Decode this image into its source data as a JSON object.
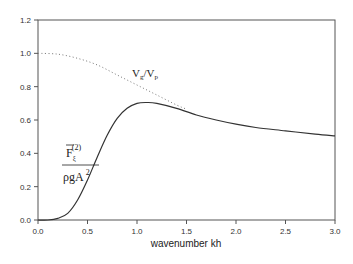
{
  "chart_data": {
    "type": "line",
    "title": "",
    "xlabel": "wavenumber kh",
    "ylabel": "",
    "xlim": [
      0.0,
      3.0
    ],
    "ylim": [
      0.0,
      1.2
    ],
    "grid": false,
    "legend": "none",
    "x_ticks": [
      "0.0",
      "0.5",
      "1.0",
      "1.5",
      "2.0",
      "2.5",
      "3.0"
    ],
    "y_ticks": [
      "0.0",
      "0.2",
      "0.4",
      "0.6",
      "0.8",
      "1.0",
      "1.2"
    ],
    "series": [
      {
        "name": "mean second-order force",
        "style": "solid",
        "color": "#333333",
        "x": [
          0.0,
          0.1,
          0.2,
          0.3,
          0.4,
          0.5,
          0.6,
          0.7,
          0.8,
          0.9,
          1.0,
          1.1,
          1.2,
          1.4,
          1.6,
          1.8,
          2.0,
          2.2,
          2.5,
          2.8,
          3.0
        ],
        "y": [
          0.0,
          0.0,
          0.01,
          0.04,
          0.12,
          0.24,
          0.38,
          0.51,
          0.61,
          0.67,
          0.7,
          0.705,
          0.7,
          0.67,
          0.63,
          0.6,
          0.575,
          0.555,
          0.535,
          0.515,
          0.505
        ]
      },
      {
        "name": "Vg/Vp",
        "style": "dotted",
        "color": "#777777",
        "x": [
          0.0,
          0.2,
          0.4,
          0.6,
          0.8,
          1.0,
          1.2,
          1.4,
          1.5
        ],
        "y": [
          1.0,
          0.995,
          0.97,
          0.93,
          0.87,
          0.81,
          0.75,
          0.69,
          0.665
        ]
      }
    ],
    "annotations": {
      "vgvp": {
        "main1": "V",
        "sub1": "g",
        "slash": "/",
        "main2": "V",
        "sub2": "p",
        "at": [
          0.95,
          0.86
        ]
      },
      "force": {
        "numerator_main": "F",
        "numerator_sub": "ξ",
        "numerator_sup": "(2)",
        "denominator_main": "ρgA",
        "denominator_sup": "2",
        "at": [
          0.3,
          0.48
        ]
      }
    }
  }
}
